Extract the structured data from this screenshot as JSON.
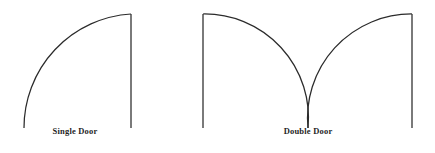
{
  "figure": {
    "background_color": "#ffffff",
    "stroke_color": "#2b2b2b",
    "label_color": "#1f1f1f",
    "width": 435,
    "height": 153
  },
  "diagrams": [
    {
      "id": "single-door",
      "label": "Single Door",
      "label_x": 75,
      "label_y": 127,
      "hinge_x": 131,
      "hinge_y": 128,
      "radius": 114,
      "leaf_top_y": 14,
      "arc_start_x": 24,
      "arc_start_y": 128,
      "leaf_path": "M 131 128 L 131 14",
      "swing_path": "M 24 128 A 114 114 0 0 1 131 14"
    },
    {
      "id": "double-door",
      "label": "Double Door",
      "label_x": 308,
      "label_y": 127,
      "left_jamb_x": 203,
      "right_jamb_x": 412,
      "center_x": 308,
      "jamb_top_y": 14,
      "jamb_bottom_y": 128,
      "radius": 104,
      "left_leaf_path": "M 203 128 L 203 14",
      "right_leaf_path": "M 412 128 L 412 14",
      "left_swing_path": "M 203 14 A 104 104 0 0 1 308 128",
      "right_swing_path": "M 412 14 A 104 104 0 0 0 308 128"
    }
  ]
}
